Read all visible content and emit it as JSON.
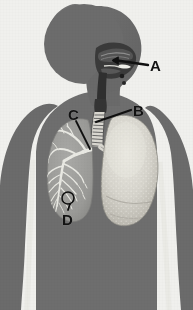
{
  "figure": {
    "kind": "anatomical-diagram",
    "orientation": "head in right profile, torso frontal",
    "background_color": "#f0f0ed",
    "body_color": "#6e6e6e",
    "airway_color": "#3b3b3b",
    "lung_left_color": "#9d9d9d",
    "lung_right_color": "#d8d6cf",
    "bronchi_color": "#e8e8e2",
    "label_color": "#121212",
    "leader_color": "#101010"
  },
  "labels": [
    {
      "id": "A",
      "text": "A",
      "target": "nasal-cavity",
      "text_left": 150,
      "text_top": 58,
      "leader_from": [
        148,
        66
      ],
      "leader_to": [
        114,
        62
      ]
    },
    {
      "id": "B",
      "text": "B",
      "target": "trachea",
      "text_left": 133,
      "text_top": 103,
      "leader_from": [
        131,
        111
      ],
      "leader_to": [
        95,
        122
      ]
    },
    {
      "id": "C",
      "text": "C",
      "target": "bronchus",
      "text_left": 68,
      "text_top": 107,
      "leader_from": [
        75,
        120
      ],
      "leader_to": [
        88,
        148
      ]
    },
    {
      "id": "D",
      "text": "D",
      "target": "alveoli",
      "text_left": 62,
      "text_top": 212,
      "leader_from": [
        68,
        211
      ],
      "leader_to": [
        70,
        203
      ],
      "marker_circle": {
        "cx": 68,
        "cy": 198,
        "r": 6
      }
    }
  ],
  "anatomy_parts": [
    {
      "name": "head-silhouette",
      "label": ""
    },
    {
      "name": "torso-silhouette",
      "label": ""
    },
    {
      "name": "left-arm-silhouette",
      "label": ""
    },
    {
      "name": "right-arm-silhouette",
      "label": ""
    },
    {
      "name": "nasal-cavity",
      "label": "A"
    },
    {
      "name": "pharynx",
      "label": ""
    },
    {
      "name": "larynx",
      "label": ""
    },
    {
      "name": "trachea",
      "label": "B"
    },
    {
      "name": "primary-bronchus",
      "label": "C"
    },
    {
      "name": "bronchial-tree",
      "label": ""
    },
    {
      "name": "left-lung-cutaway",
      "label": ""
    },
    {
      "name": "right-lung-surface",
      "label": ""
    },
    {
      "name": "alveoli-region",
      "label": "D"
    }
  ]
}
